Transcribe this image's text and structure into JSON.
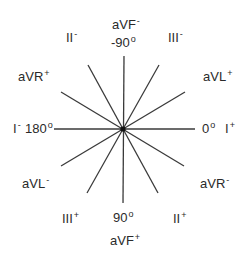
{
  "diagram": {
    "center": {
      "x": 123,
      "y": 129
    },
    "line_color": "#3a3a3a",
    "axes": [
      {
        "name": "I",
        "angle_deg": 0,
        "x1": 54,
        "y1": 129,
        "x2": 195,
        "y2": 129
      },
      {
        "name": "aVF",
        "angle_deg": 90,
        "x1": 124,
        "y1": 56,
        "x2": 123,
        "y2": 203
      },
      {
        "name": "II",
        "angle_deg": 60,
        "x1": 88,
        "y1": 65,
        "x2": 158,
        "y2": 193
      },
      {
        "name": "III",
        "angle_deg": 120,
        "x1": 159,
        "y1": 65,
        "x2": 87,
        "y2": 193
      },
      {
        "name": "aVR",
        "angle_deg": -150,
        "x1": 61,
        "y1": 92,
        "x2": 184,
        "y2": 166
      },
      {
        "name": "aVL",
        "angle_deg": -30,
        "x1": 185,
        "y1": 92,
        "x2": 61,
        "y2": 166
      }
    ],
    "labels": {
      "avf_minus": {
        "base": "aVF",
        "sign": "-"
      },
      "neg90": {
        "base": "-90",
        "sign": "o"
      },
      "ii_minus": {
        "base": "II",
        "sign": "-"
      },
      "iii_minus": {
        "base": "III",
        "sign": "-"
      },
      "avr_plus": {
        "base": "aVR",
        "sign": "+"
      },
      "avl_plus": {
        "base": "aVL",
        "sign": "+"
      },
      "i_minus": {
        "base": "I",
        "sign": "-"
      },
      "deg180": {
        "base": "180",
        "sign": "o"
      },
      "deg0": {
        "base": "0",
        "sign": "o"
      },
      "i_plus": {
        "base": "I",
        "sign": "+"
      },
      "avl_minus": {
        "base": "aVL",
        "sign": "-"
      },
      "avr_minus": {
        "base": "aVR",
        "sign": "-"
      },
      "iii_plus": {
        "base": "III",
        "sign": "+"
      },
      "deg90": {
        "base": "90",
        "sign": "o"
      },
      "ii_plus": {
        "base": "II",
        "sign": "+"
      },
      "avf_plus": {
        "base": "aVF",
        "sign": "+"
      }
    }
  }
}
